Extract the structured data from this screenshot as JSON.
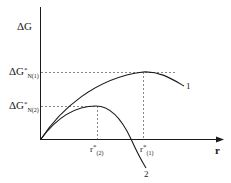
{
  "diagram": {
    "y_axis_label": "ΔG",
    "x_axis_label": "r",
    "y_marks": [
      {
        "base": "ΔG",
        "sup": "*",
        "sub": "N(1)"
      },
      {
        "base": "ΔG",
        "sup": "*",
        "sub": "N(2)"
      }
    ],
    "x_marks": [
      {
        "base": "r",
        "sup": "*",
        "sub": "(2)"
      },
      {
        "base": "r",
        "sup": "*",
        "sub": "(1)"
      }
    ],
    "curves": [
      {
        "label": "1"
      },
      {
        "label": "2"
      }
    ],
    "colors": {
      "line": "#1a1a1a",
      "dash": "#555555"
    }
  }
}
